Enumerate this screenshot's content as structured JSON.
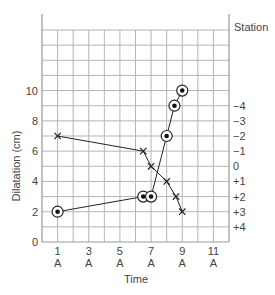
{
  "chart_data": {
    "type": "line",
    "title": "",
    "xlabel": "Time",
    "ylabel": "Dilatation (cm)",
    "y2label": "Station",
    "xlim": [
      0,
      12
    ],
    "ylim": [
      0,
      14
    ],
    "grid": true,
    "legend": null,
    "x_ticks": [
      {
        "value": 1,
        "label": "1",
        "sublabel": "A"
      },
      {
        "value": 3,
        "label": "3",
        "sublabel": "A"
      },
      {
        "value": 5,
        "label": "5",
        "sublabel": "A"
      },
      {
        "value": 7,
        "label": "7",
        "sublabel": "A"
      },
      {
        "value": 9,
        "label": "9",
        "sublabel": "A"
      },
      {
        "value": 11,
        "label": "11",
        "sublabel": "A"
      }
    ],
    "y_ticks": [
      {
        "value": 0,
        "label": "0"
      },
      {
        "value": 2,
        "label": "2"
      },
      {
        "value": 4,
        "label": "4"
      },
      {
        "value": 6,
        "label": "6"
      },
      {
        "value": 8,
        "label": "8"
      },
      {
        "value": 10,
        "label": "10"
      }
    ],
    "y2_ticks": [
      {
        "value": 9,
        "label": "−4"
      },
      {
        "value": 8,
        "label": "−3"
      },
      {
        "value": 7,
        "label": "−2"
      },
      {
        "value": 6,
        "label": "−1"
      },
      {
        "value": 5,
        "label": "0"
      },
      {
        "value": 4,
        "label": "+1"
      },
      {
        "value": 3,
        "label": "+2"
      },
      {
        "value": 2,
        "label": "+3"
      },
      {
        "value": 1,
        "label": "+4"
      }
    ],
    "series": [
      {
        "name": "Cervical dilatation",
        "marker": "circled-dot",
        "axis": "left",
        "x": [
          1,
          6.5,
          7,
          8,
          8.5,
          9
        ],
        "values": [
          2,
          3,
          3,
          7,
          9,
          10
        ]
      },
      {
        "name": "Station (descent)",
        "marker": "x",
        "axis": "right",
        "x": [
          1,
          6.5,
          7,
          8,
          8.6,
          9
        ],
        "values": [
          7,
          6,
          5,
          4,
          3,
          2
        ],
        "station_values": [
          "−2",
          "−1",
          "0",
          "+1",
          "+2",
          "+3"
        ]
      }
    ]
  }
}
